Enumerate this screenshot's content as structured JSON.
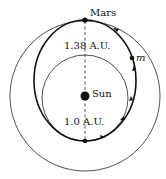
{
  "diagram": {
    "labels": {
      "mars": "Mars",
      "sun": "Sun",
      "mass": "m",
      "mars_distance": "1.38 A.U.",
      "earth_distance": "1.0 A.U."
    },
    "colors": {
      "line": "#111111",
      "background": "#ffffff"
    }
  }
}
